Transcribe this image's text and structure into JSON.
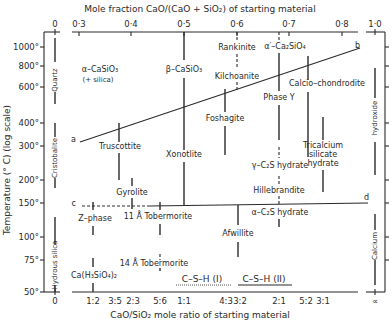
{
  "top_axis": {
    "title": "Mole fraction CaO/(CaO + SiO₂) of starting material",
    "ticks": [
      "0",
      "0·3",
      "0·4",
      "0·5",
      "0·6",
      "0·7",
      "0·8",
      "1·0"
    ]
  },
  "bottom_axis": {
    "title": "CaO/SiO₂ mole ratio of starting material",
    "ticks": [
      "0",
      "1:2",
      "3:5",
      "2:3",
      "5:6",
      "1:1",
      "4:3",
      "3:2",
      "2:1",
      "5:2",
      "3:1",
      "∝"
    ]
  },
  "left_axis": {
    "title": "Temperature (° C) (log scale)",
    "ticks": [
      "1000°",
      "800°",
      "600°",
      "400°",
      "300°",
      "200°",
      "150°",
      "100°",
      "75°",
      "50°"
    ]
  },
  "line_labels": {
    "a": "a",
    "b": "b",
    "c": "c",
    "d": "d"
  },
  "side_phases": {
    "quartz": "Quartz",
    "cristobalite": "Cristobalite",
    "hydrous_silica": "Hydrous silica",
    "calcium_hydroxide_top": "hydroxide",
    "calcium_hydroxide_bottom": "Calcium"
  },
  "phases": {
    "alpha_casio3": "α–CaSiO₃",
    "alpha_casio3_note": "(+ silica)",
    "beta_casio3": "β–CaSiO₃",
    "rankinite": "Rankinite",
    "alpha_prime_c2s": "α′–Ca₂SiO₄",
    "kilchoanite": "Kilchoanite",
    "calcio_chondrodite": "Calcio–chondrodite",
    "phase_y": "Phase Y",
    "foshagite": "Foshagite",
    "truscottite": "Truscottite",
    "xonotlite": "Xonotlite",
    "gamma_c2s_hydrate": "γ–C₂S hydrate",
    "tricalcium_1": "Tricalcium",
    "tricalcium_2": "silicate",
    "tricalcium_3": "hydrate",
    "gyrolite": "Gyrolite",
    "hillebrandite": "Hillebrandite",
    "z_phase": "Z–phase",
    "tobermorite_11": "11 Å Tobermorite",
    "alpha_c2s_hydrate": "α–C₂S hydrate",
    "afwillite": "Afwillite",
    "tobermorite_14": "14 Å Tobermorite",
    "ca_h3sio4": "Ca(H₃SiO₄)₂",
    "csh1": "C–S–H (I)",
    "csh2": "C–S–H (II)"
  }
}
